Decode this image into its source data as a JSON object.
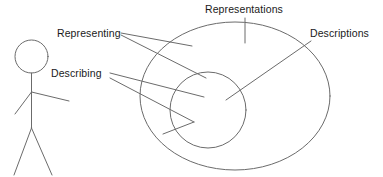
{
  "diagram": {
    "type": "venn-style concept diagram",
    "background_color": "#ffffff",
    "stroke_color": "#6b6b6b",
    "text_color": "#1a1a1a",
    "labels": {
      "representing": "Representing",
      "describing": "Describing",
      "representations": "Representations",
      "descriptions": "Descriptions"
    },
    "shapes": {
      "actor": "stick-figure",
      "outer_region": "Representations",
      "inner_region": "Descriptions"
    }
  }
}
